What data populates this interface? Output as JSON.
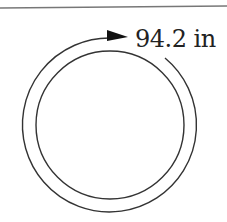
{
  "diagram": {
    "type": "circle-circumference",
    "circumference_label": "94.2 in",
    "colors": {
      "stroke": "#333333",
      "background": "#ffffff"
    }
  }
}
